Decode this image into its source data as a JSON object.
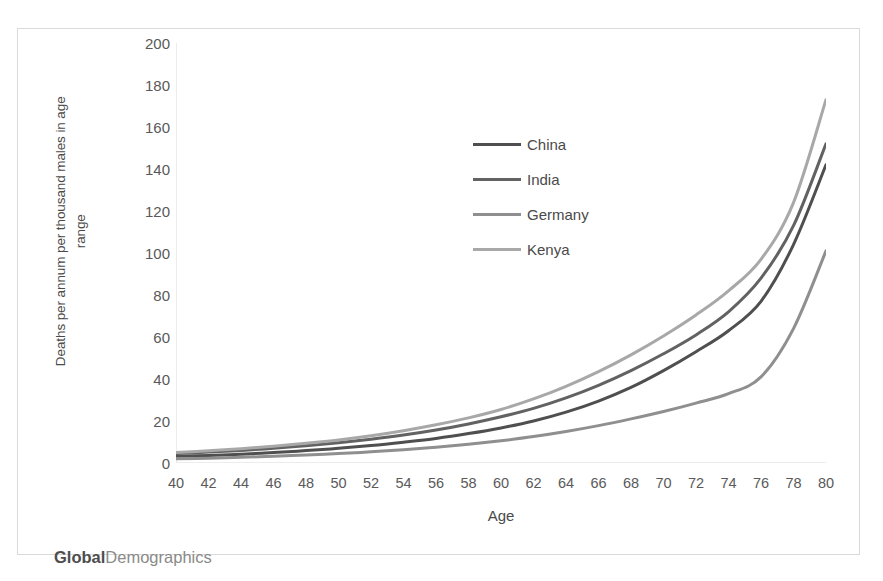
{
  "chart_data": {
    "type": "line",
    "title": "",
    "xlabel": "Age",
    "ylabel": "Deaths per annum per thousand males in age range",
    "ylabel_line1": "Deaths per annum per thousand males in age",
    "ylabel_line2": "range",
    "xlim": [
      40,
      80
    ],
    "ylim": [
      0,
      200
    ],
    "y_ticks": [
      200,
      180,
      160,
      140,
      120,
      100,
      80,
      60,
      40,
      20,
      0
    ],
    "x_ticks": [
      40,
      42,
      44,
      46,
      48,
      50,
      52,
      54,
      56,
      58,
      60,
      62,
      64,
      66,
      68,
      70,
      72,
      74,
      76,
      78,
      80
    ],
    "x": [
      40,
      42,
      44,
      46,
      48,
      50,
      52,
      54,
      56,
      58,
      60,
      62,
      64,
      66,
      68,
      70,
      72,
      74,
      76,
      78,
      80
    ],
    "grid": false,
    "legend_position": "center-upper",
    "series": [
      {
        "name": "China",
        "color": "#4f4f4f",
        "values": [
          3.2,
          3.6,
          4.2,
          5.0,
          5.9,
          7.0,
          8.3,
          9.9,
          11.7,
          14.0,
          16.7,
          20.0,
          24.2,
          29.5,
          36.0,
          44.0,
          53.0,
          63.0,
          77.0,
          104.0,
          142.0
        ]
      },
      {
        "name": "India",
        "color": "#626262",
        "values": [
          4.5,
          5.2,
          6.0,
          7.0,
          8.2,
          9.6,
          11.3,
          13.3,
          15.7,
          18.6,
          22.0,
          26.0,
          31.0,
          37.0,
          44.0,
          52.0,
          61.0,
          72.0,
          88.0,
          113.0,
          152.0
        ]
      },
      {
        "name": "Germany",
        "color": "#8f8f8f",
        "values": [
          2.0,
          2.3,
          2.7,
          3.2,
          3.8,
          4.5,
          5.3,
          6.3,
          7.5,
          8.9,
          10.6,
          12.6,
          15.0,
          17.8,
          21.0,
          24.5,
          28.5,
          33.0,
          41.0,
          64.0,
          101.0
        ]
      },
      {
        "name": "Kenya",
        "color": "#a8a8a8",
        "values": [
          5.0,
          5.8,
          6.8,
          8.0,
          9.4,
          11.0,
          13.0,
          15.4,
          18.2,
          21.5,
          25.5,
          30.5,
          36.5,
          43.5,
          51.5,
          60.5,
          70.5,
          82.0,
          97.0,
          124.0,
          173.0
        ]
      }
    ]
  },
  "legend": {
    "items": [
      {
        "label": "China"
      },
      {
        "label": "India"
      },
      {
        "label": "Germany"
      },
      {
        "label": "Kenya"
      }
    ]
  },
  "watermark": {
    "strong": "Global",
    "light": "Demographics"
  },
  "colors": {
    "frame_border": "#d9d9d9",
    "axis_line": "#d9d9d9",
    "tick_text": "#595959",
    "title_text": "#4a4a4a"
  }
}
